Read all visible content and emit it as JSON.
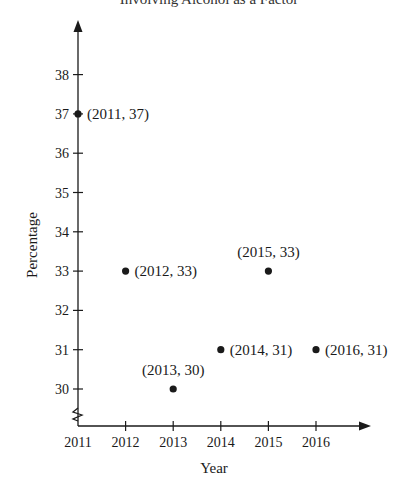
{
  "chart_data": {
    "type": "scatter",
    "title": "Involving Alcohol as a Factor",
    "xlabel": "Year",
    "ylabel": "Percentage",
    "x_ticks": [
      2011,
      2012,
      2013,
      2014,
      2015,
      2016
    ],
    "y_ticks": [
      30,
      31,
      32,
      33,
      34,
      35,
      36,
      37,
      38
    ],
    "xlim": [
      2011,
      2017
    ],
    "ylim": [
      29,
      39
    ],
    "y_axis_break": true,
    "grid": false,
    "legend": null,
    "points": [
      {
        "x": 2011,
        "y": 37,
        "label": "(2011, 37)",
        "label_pos": "right"
      },
      {
        "x": 2012,
        "y": 33,
        "label": "(2012, 33)",
        "label_pos": "right"
      },
      {
        "x": 2013,
        "y": 30,
        "label": "(2013, 30)",
        "label_pos": "above"
      },
      {
        "x": 2014,
        "y": 31,
        "label": "(2014, 31)",
        "label_pos": "right"
      },
      {
        "x": 2015,
        "y": 33,
        "label": "(2015, 33)",
        "label_pos": "above"
      },
      {
        "x": 2016,
        "y": 31,
        "label": "(2016, 31)",
        "label_pos": "right"
      }
    ]
  },
  "colors": {
    "ink": "#1a1a1a",
    "background": "#ffffff"
  }
}
